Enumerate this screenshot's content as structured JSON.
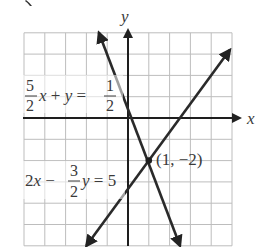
{
  "figure": {
    "axis_labels": {
      "x": "x",
      "y": "y"
    },
    "grid": {
      "x_min": -5,
      "x_max": 5,
      "y_min": -6,
      "y_max": 4,
      "step": 1
    },
    "lines": [
      {
        "id": "line1",
        "equation_text": "5/2 x + y = 1/2",
        "coef_num": "5",
        "coef_den": "2",
        "rhs_num": "1",
        "rhs_den": "2",
        "from": [
          -1.4,
          4.0
        ],
        "to": [
          2.5,
          -6.0
        ]
      },
      {
        "id": "line2",
        "equation_text": "2x − 3/2 y = 5",
        "lead": "2x −",
        "coef_num": "3",
        "coef_den": "2",
        "rhs": "= 5",
        "from": [
          -2.0,
          -6.0
        ],
        "to": [
          4.9,
          3.2
        ]
      }
    ],
    "intersection": {
      "x": 1,
      "y": -2,
      "label": "(1, −2)"
    },
    "colors": {
      "line": "#2a2a2a",
      "grid": "#bdbdbd",
      "axis": "#1e1e1e",
      "text": "#3a3a3a"
    }
  },
  "chart_data": {
    "type": "line",
    "title": "",
    "xlabel": "x",
    "ylabel": "y",
    "xlim": [
      -5,
      5
    ],
    "ylim": [
      -6,
      4
    ],
    "grid": true,
    "series": [
      {
        "name": "5/2 x + y = 1/2",
        "x": [
          -1.4,
          2.5
        ],
        "y": [
          4.0,
          -6.0
        ]
      },
      {
        "name": "2x − 3/2 y = 5",
        "x": [
          -2.0,
          4.9
        ],
        "y": [
          -6.0,
          3.2
        ]
      }
    ],
    "annotations": [
      {
        "text": "(1, −2)",
        "x": 1,
        "y": -2
      },
      {
        "text": "5/2 x + y = 1/2",
        "x": -4.8,
        "y": 0.5
      },
      {
        "text": "2x − 3/2 y = 5",
        "x": -4.8,
        "y": -2.6
      }
    ]
  }
}
